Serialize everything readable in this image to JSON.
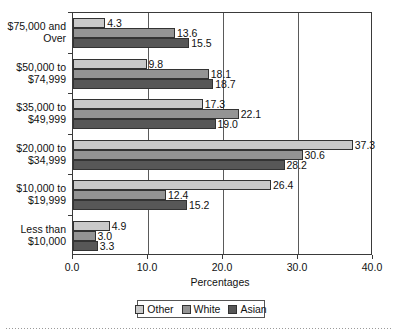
{
  "chart_data": {
    "type": "bar",
    "orientation": "horizontal",
    "title": "",
    "xlabel": "Percentages",
    "ylabel": "",
    "xlim": [
      0.0,
      40.0
    ],
    "xticks": [
      "0.0",
      "10.0",
      "20.0",
      "30.0",
      "40.0"
    ],
    "xtick_values": [
      0.0,
      10.0,
      20.0,
      30.0,
      40.0
    ],
    "grid": true,
    "legend_position": "bottom-center",
    "categories": [
      "$75,000 and\nOver",
      "$50,000 to\n$74,999",
      "$35,000 to\n$49,999",
      "$20,000 to\n$34,999",
      "$10,000 to\n$19,999",
      "Less than\n$10,000"
    ],
    "series": [
      {
        "name": "Other",
        "color": "#c9c9c9",
        "values": [
          4.3,
          9.8,
          17.3,
          37.3,
          26.4,
          4.9
        ],
        "labels": [
          "4.3",
          "9.8",
          "17.3",
          "37.3",
          "26.4",
          "4.9"
        ]
      },
      {
        "name": "White",
        "color": "#949494",
        "values": [
          13.6,
          18.1,
          22.1,
          30.6,
          12.4,
          3.0
        ],
        "labels": [
          "13.6",
          "18.1",
          "22.1",
          "30.6",
          "12.4",
          "3.0"
        ]
      },
      {
        "name": "Asian",
        "color": "#575757",
        "values": [
          15.5,
          18.7,
          19.0,
          28.2,
          15.2,
          3.3
        ],
        "labels": [
          "15.5",
          "18.7",
          "19.0",
          "28.2",
          "15.2",
          "3.3"
        ]
      }
    ]
  },
  "legend": {
    "items": [
      {
        "label": "Other",
        "color": "#c9c9c9"
      },
      {
        "label": "White",
        "color": "#949494"
      },
      {
        "label": "Asian",
        "color": "#575757"
      }
    ]
  },
  "axis": {
    "x_title": "Percentages"
  }
}
